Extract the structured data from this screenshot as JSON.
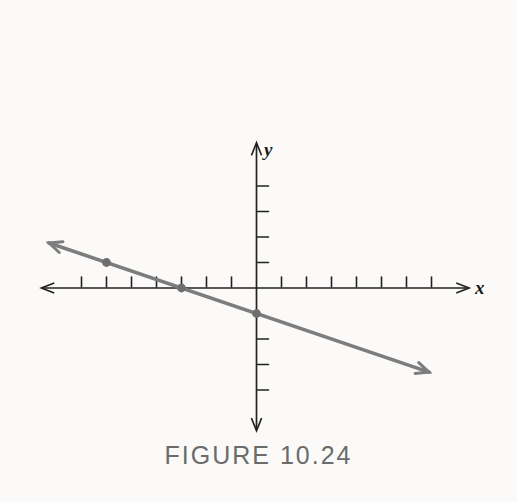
{
  "figure": {
    "caption": "FIGURE 10.24",
    "x_axis_label": "x",
    "y_axis_label": "y"
  },
  "chart_data": {
    "type": "line",
    "title": "FIGURE 10.24",
    "xlabel": "x",
    "ylabel": "y",
    "grid": false,
    "xlim": [
      -8.6,
      8.5
    ],
    "ylim": [
      -5.6,
      5.7
    ],
    "x_ticks": [
      -7,
      -6,
      -5,
      -4,
      -3,
      -2,
      -1,
      1,
      2,
      3,
      4,
      5,
      6,
      7
    ],
    "y_ticks": [
      4,
      3,
      2,
      1,
      -2,
      -3,
      -4
    ],
    "series": [
      {
        "name": "line-through-points",
        "slope": -0.33333,
        "y_intercept": -1,
        "x_intercept": -3,
        "x_start": -8.3,
        "x_end": 6.9,
        "marked_points": [
          [
            -6,
            1
          ],
          [
            -3,
            0
          ],
          [
            0,
            -1
          ]
        ]
      }
    ]
  },
  "colors": {
    "background": "#fbfaf8",
    "axis": "#222222",
    "line": "#7d7d7d",
    "point": "#6e6e6e",
    "caption": "#6b6b6b",
    "axis_label": "#1a1a1a"
  }
}
